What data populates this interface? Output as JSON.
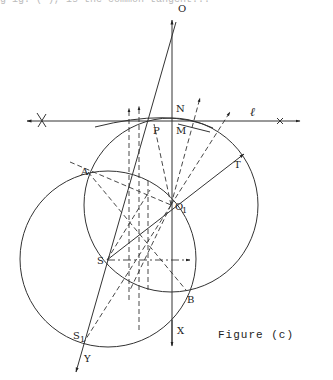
{
  "figure": {
    "caption": "Figure (c)",
    "top_text_fragment": "g  ig. ( ), is the common tangent..."
  },
  "labels": {
    "O": "O",
    "N": "N",
    "P": "P",
    "M": "M",
    "l": "ℓ",
    "T": "T",
    "A": "A",
    "O1": "O",
    "O1_sub": "1",
    "S": "S",
    "B": "B",
    "S1": "S",
    "S1_sub": "1",
    "X": "X",
    "Y": "Y"
  },
  "geometry": {
    "circle_right": {
      "cx": 171,
      "cy": 205,
      "r": 87
    },
    "circle_left": {
      "cx": 108,
      "cy": 259,
      "r": 88
    },
    "line_l_y": 121
  }
}
